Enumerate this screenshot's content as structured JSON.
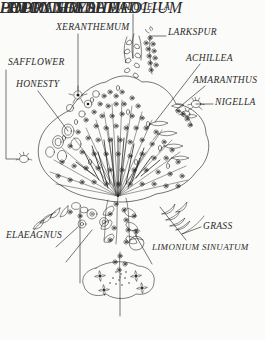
{
  "figure": {
    "style": "pen-and-ink line illustration with leader-line callout labels",
    "background_color": "#fbfbf9",
    "ink_color": "#1a1a1a",
    "label_color": "#2b2b2b",
    "width": 265,
    "height": 340
  },
  "labels": {
    "molucella": "MOLUCELLA",
    "xeranthemum": "XERANTHEMUM",
    "larkspur": "LARKSPUR",
    "safflower": "SAFFLOWER",
    "achillea": "ACHILLEA",
    "honesty": "HONESTY",
    "amaranthus": "AMARANTHUS",
    "nigella": "NIGELLA",
    "grass": "GRASS",
    "elaeagnus": "ELAEAGNUS",
    "limonium_sinuatum": "LIMONIUM SINUATUM",
    "helichrysum": "HELICHRYSUM",
    "poppy_seedhead": "POPPY SEEDHEAD",
    "hydrangea": "HYDRANGEA",
    "limonium_latifolium": "LIMONIUM LATIFOLIUM"
  },
  "callouts": [
    {
      "name": "molucella",
      "label": "MOLUCELLA",
      "text_x": 112,
      "text_y": 3,
      "leader": "vertical drop from label to upper-centre spire"
    },
    {
      "name": "xeranthemum",
      "label": "XERANTHEMUM",
      "text_x": 56,
      "text_y": 23,
      "leader": "vertical drop from label into left-centre flower head"
    },
    {
      "name": "larkspur",
      "label": "LARKSPUR",
      "text_x": 168,
      "text_y": 28,
      "leader": "short horizontal line to tall right spike"
    },
    {
      "name": "safflower",
      "label": "SAFFLOWER",
      "text_x": 8,
      "text_y": 58,
      "leader": "long left margin bracket down to lower-left bloom"
    },
    {
      "name": "achillea",
      "label": "ACHILLEA",
      "text_x": 186,
      "text_y": 54,
      "leader": "long diagonal down-left into right side of bouquet"
    },
    {
      "name": "honesty",
      "label": "HONESTY",
      "text_x": 16,
      "text_y": 80,
      "leader": "diagonal down-right to papery disc seed pods"
    },
    {
      "name": "amaranthus",
      "label": "AMARANTHUS",
      "text_x": 193,
      "text_y": 76,
      "leader": "diagonal down-left to drooping right tassel"
    },
    {
      "name": "nigella",
      "label": "NIGELLA",
      "text_x": 215,
      "text_y": 98,
      "leader": "short horizontal line to right-hand seed pod"
    },
    {
      "name": "grass",
      "label": "GRASS",
      "text_x": 203,
      "text_y": 222,
      "leader": "short diagonal up-left to spiky grass fronds"
    },
    {
      "name": "elaeagnus",
      "label": "ELAEAGNUS",
      "text_x": 6,
      "text_y": 231,
      "leader": "label sits beside the lower-left leaf sprays"
    },
    {
      "name": "limonium_sinuatum",
      "label": "LIMONIUM SINUATUM",
      "text_x": 152,
      "text_y": 243,
      "leader": "diagonal up-left into the centre-bottom cluster"
    },
    {
      "name": "helichrysum",
      "label": "HELICHRYSUM",
      "text_x": 8,
      "text_y": 255,
      "leader": "diagonal up-right to round straw-flower heads"
    },
    {
      "name": "poppy_seedhead",
      "label": "POPPY SEEDHEAD",
      "text_x": 141,
      "text_y": 268,
      "leader": "diagonal up-left to the capsule seed head"
    },
    {
      "name": "hydrangea",
      "label": "HYDRANGEA",
      "text_x": 28,
      "text_y": 287,
      "leader": "long vertical line up to the hydrangea floret mass"
    },
    {
      "name": "limonium_latifolium",
      "label": "LIMONIUM LATIFOLIUM",
      "text_x": 72,
      "text_y": 320,
      "leader": "vertical line up to the lowest hanging spray"
    }
  ]
}
